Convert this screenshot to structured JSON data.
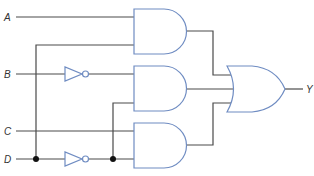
{
  "diagram": {
    "type": "logic-circuit",
    "inputs": [
      {
        "id": "A",
        "label": "A"
      },
      {
        "id": "B",
        "label": "B"
      },
      {
        "id": "C",
        "label": "C"
      },
      {
        "id": "D",
        "label": "D"
      }
    ],
    "output": {
      "id": "Y",
      "label": "Y"
    },
    "gates": [
      {
        "id": "not-b",
        "type": "NOT",
        "inputs": [
          "B"
        ]
      },
      {
        "id": "not-d",
        "type": "NOT",
        "inputs": [
          "D"
        ]
      },
      {
        "id": "and-1",
        "type": "AND",
        "inputs": [
          "A",
          "D"
        ]
      },
      {
        "id": "and-2",
        "type": "AND",
        "inputs": [
          "B'",
          "D'"
        ]
      },
      {
        "id": "and-3",
        "type": "AND",
        "inputs": [
          "C",
          "D'"
        ]
      },
      {
        "id": "or-1",
        "type": "OR",
        "inputs": [
          "and-1",
          "and-2",
          "and-3"
        ],
        "output": "Y"
      }
    ],
    "colors": {
      "wire": "#4a4a4a",
      "gate_outline": "#6f8cc2",
      "junction": "#111111"
    }
  }
}
